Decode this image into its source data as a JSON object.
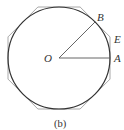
{
  "figure": {
    "caption": "(b)",
    "labels": {
      "center": "O",
      "point_a": "A",
      "point_b": "B",
      "point_e": "E"
    },
    "colors": {
      "circle": "#333333",
      "octagon": "#a8a8a8",
      "radius": "#555555",
      "text": "#333333"
    }
  }
}
